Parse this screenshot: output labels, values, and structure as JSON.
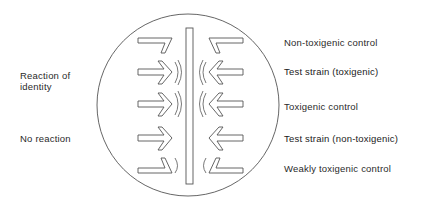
{
  "diagram": {
    "stroke_color": "#555555",
    "left_labels": [
      {
        "text": "Reaction of",
        "y": 70
      },
      {
        "text": "identity",
        "y": 81
      },
      {
        "text": "No reaction",
        "y": 133
      }
    ],
    "right_labels": [
      {
        "text": "Non-toxigenic control",
        "y": 37,
        "emphasis": false
      },
      {
        "text": "Test strain (toxigenic)",
        "y": 66,
        "emphasis": true
      },
      {
        "text": "Toxigenic control",
        "y": 101,
        "emphasis": false
      },
      {
        "text": "Test strain (non-toxigenic)",
        "y": 133,
        "emphasis": true
      },
      {
        "text": "Weakly toxigenic control",
        "y": 163,
        "emphasis": false
      }
    ]
  }
}
